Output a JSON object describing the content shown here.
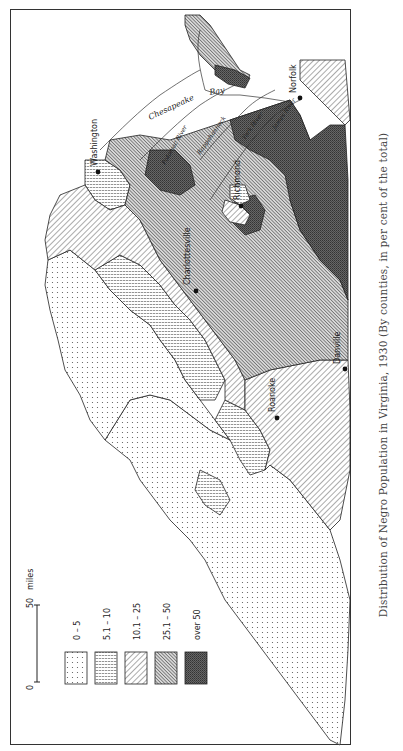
{
  "caption": "Distribution of Negro Population in Virginia, 1930 (By counties, in per cent of the total)",
  "scale": {
    "start": "0",
    "end": "50",
    "unit": "miles"
  },
  "legend": {
    "items": [
      {
        "label": "0 – 5",
        "pattern": "dots"
      },
      {
        "label": "5.1 – 10",
        "pattern": "horizontal-lines"
      },
      {
        "label": "10.1 – 25",
        "pattern": "sparse-diagonal"
      },
      {
        "label": "25.1 – 50",
        "pattern": "dense-diagonal"
      },
      {
        "label": "over 50",
        "pattern": "crosshatch-dark"
      }
    ]
  },
  "cities": [
    {
      "name": "Washington"
    },
    {
      "name": "Richmond"
    },
    {
      "name": "Charlottesville"
    },
    {
      "name": "Norfolk"
    },
    {
      "name": "Roanoke"
    },
    {
      "name": "Danville"
    }
  ],
  "water_labels": [
    {
      "name": "Chesapeake"
    },
    {
      "name": "Bay"
    },
    {
      "name": "Potomac River"
    },
    {
      "name": "Rappahannock"
    },
    {
      "name": "York River"
    },
    {
      "name": "James River"
    }
  ],
  "colors": {
    "ink": "#222222",
    "background": "#ffffff",
    "dark_fill": "#555555"
  }
}
